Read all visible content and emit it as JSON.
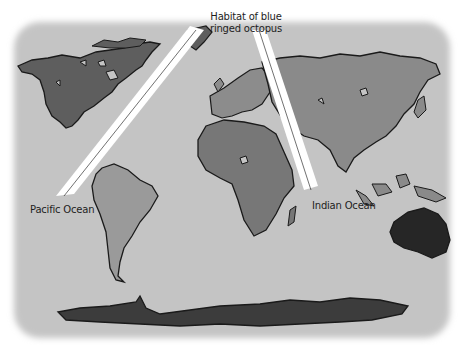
{
  "map": {
    "title_line1": "Habitat of blue",
    "title_line2": "ringed octopus",
    "labels": {
      "pacific": "Pacific Ocean",
      "indian": "Indian Ocean"
    },
    "colors": {
      "ocean": "#c4c4c4",
      "north_america": "#5e5e5e",
      "south_america": "#9a9a9a",
      "europe": "#8c8c8c",
      "africa": "#777777",
      "asia": "#8a8a8a",
      "australia": "#262626",
      "antarctica": "#3c3c3c",
      "outline": "#1a1a1a",
      "beam": "#ffffff"
    },
    "regions": [
      "North America",
      "South America",
      "Europe",
      "Africa",
      "Asia",
      "Australia",
      "Antarctica"
    ]
  }
}
